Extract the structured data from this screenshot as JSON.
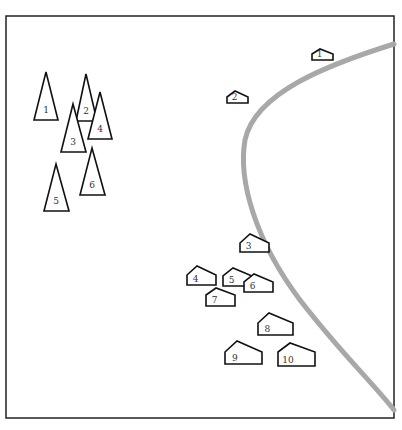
{
  "diagram": {
    "frame": {
      "x": 6,
      "y": 16,
      "width": 388,
      "height": 402,
      "stroke": "#222222"
    },
    "boundary_curve": {
      "color": "#a8a8a8",
      "width": 5
    },
    "triangles": [
      {
        "label": "1",
        "apex": [
          46,
          72
        ],
        "base_y": 120,
        "left": 34,
        "right": 58
      },
      {
        "label": "2",
        "apex": [
          86,
          74
        ],
        "base_y": 121,
        "left": 76,
        "right": 97
      },
      {
        "label": "3",
        "apex": [
          73,
          104
        ],
        "base_y": 152,
        "left": 61,
        "right": 86
      },
      {
        "label": "4",
        "apex": [
          100,
          92
        ],
        "base_y": 139,
        "left": 88,
        "right": 112
      },
      {
        "label": "5",
        "apex": [
          56,
          164
        ],
        "base_y": 211,
        "left": 44,
        "right": 69
      },
      {
        "label": "6",
        "apex": [
          92,
          148
        ],
        "base_y": 195,
        "left": 80,
        "right": 105
      }
    ],
    "houses": [
      {
        "label": "1",
        "left": 312,
        "right": 333,
        "bottom": 60,
        "wall": 6,
        "peak_x": 320,
        "peak_y": 49
      },
      {
        "label": "2",
        "left": 227,
        "right": 248,
        "bottom": 103,
        "wall": 6,
        "peak_x": 235,
        "peak_y": 91
      },
      {
        "label": "3",
        "left": 240,
        "right": 269,
        "bottom": 252,
        "wall": 9,
        "peak_x": 250,
        "peak_y": 234
      },
      {
        "label": "4",
        "left": 187,
        "right": 216,
        "bottom": 285,
        "wall": 10,
        "peak_x": 197,
        "peak_y": 266
      },
      {
        "label": "5",
        "left": 223,
        "right": 252,
        "bottom": 286,
        "wall": 10,
        "peak_x": 233,
        "peak_y": 268
      },
      {
        "label": "6",
        "left": 244,
        "right": 273,
        "bottom": 292,
        "wall": 10,
        "peak_x": 254,
        "peak_y": 274
      },
      {
        "label": "7",
        "left": 206,
        "right": 235,
        "bottom": 306,
        "wall": 11,
        "peak_x": 216,
        "peak_y": 288
      },
      {
        "label": "8",
        "left": 258,
        "right": 293,
        "bottom": 335,
        "wall": 12,
        "peak_x": 269,
        "peak_y": 313
      },
      {
        "label": "9",
        "left": 225,
        "right": 262,
        "bottom": 364,
        "wall": 12,
        "peak_x": 237,
        "peak_y": 341
      },
      {
        "label": "10",
        "left": 278,
        "right": 315,
        "bottom": 366,
        "wall": 14,
        "peak_x": 290,
        "peak_y": 343
      }
    ]
  }
}
